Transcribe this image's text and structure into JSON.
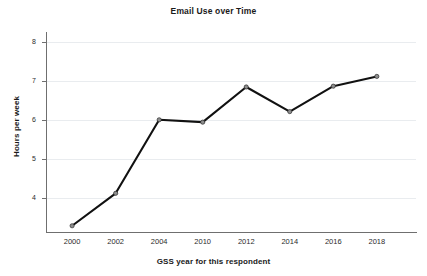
{
  "chart_data": {
    "type": "line",
    "title": "Email Use over Time",
    "xlabel": "GSS year for this respondent",
    "ylabel": "Hours per week",
    "categories": [
      "2000",
      "2002",
      "2004",
      "2010",
      "2012",
      "2014",
      "2016",
      "2018"
    ],
    "values": [
      3.3,
      4.13,
      6.01,
      5.95,
      6.85,
      6.22,
      6.87,
      7.12
    ],
    "series": [
      {
        "name": "Hours per week",
        "values": [
          3.3,
          4.13,
          6.01,
          5.95,
          6.85,
          6.22,
          6.87,
          7.12
        ]
      }
    ],
    "ytick_labels": [
      "8",
      "7",
      "6",
      "5",
      "4"
    ],
    "ytick_values": [
      8,
      7,
      6,
      5,
      4
    ],
    "ylim": [
      3.15,
      8.15
    ],
    "grid": "horizontal",
    "legend": "none",
    "marker": "circle",
    "line_color": "#111111",
    "marker_color": "#8d8d8d",
    "grid_color": "#e9ecef",
    "axis_color": "#6f6f6f"
  },
  "axes": {
    "x_title": "GSS year for this respondent",
    "y_title": "Hours per week"
  },
  "title": {
    "text": "Email Use over Time"
  }
}
